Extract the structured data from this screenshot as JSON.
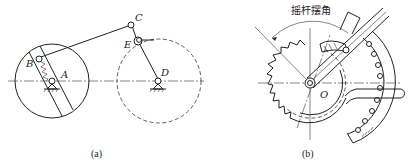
{
  "figure_a": {
    "caption": "(a)",
    "labels": {
      "A": "A",
      "B": "B",
      "C": "C",
      "D": "D",
      "E": "E"
    }
  },
  "figure_b": {
    "caption": "(b)",
    "title": "摇杆摆角",
    "labels": {
      "O": "O"
    }
  },
  "colors": {
    "line": "#222222",
    "background": "#ffffff"
  }
}
